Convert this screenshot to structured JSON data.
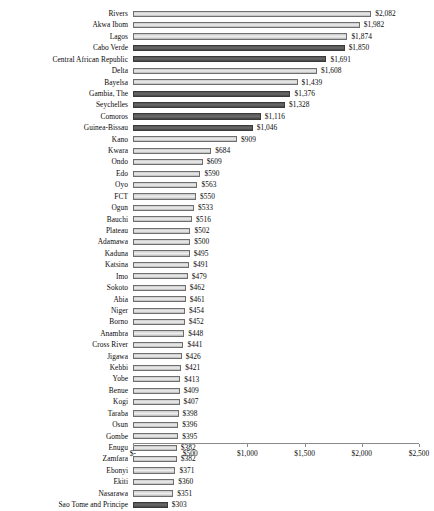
{
  "chart_data": {
    "type": "bar",
    "orientation": "horizontal",
    "title": "",
    "subtitle": "",
    "xlabel": "",
    "ylabel": "",
    "xlim": [
      0,
      2500
    ],
    "grid": false,
    "legend": null,
    "axis": {
      "tick_values": [
        0,
        500,
        1000,
        1500,
        2000,
        2500
      ],
      "tick_labels": [
        "$-",
        "$500",
        "$1,000",
        "$1,500",
        "$2,000",
        "$2,500"
      ]
    },
    "series_colors": {
      "light": "#d8d8d8",
      "dark": "#5b5b5b",
      "light_border": "#6e6e6e",
      "dark_border": "#3a3a3a"
    },
    "categories": [
      "Rivers",
      "Akwa Ibom",
      "Lagos",
      "Cabo Verde",
      "Central African Republic",
      "Delta",
      "Bayelsa",
      "Gambia, The",
      "Seychelles",
      "Comoros",
      "Guinea-Bissau",
      "Kano",
      "Kwara",
      "Ondo",
      "Edo",
      "Oyo",
      "FCT",
      "Ogun",
      "Bauchi",
      "Plateau",
      "Adamawa",
      "Kaduna",
      "Katsina",
      "Imo",
      "Sokoto",
      "Abia",
      "Niger",
      "Borno",
      "Anambra",
      "Cross River",
      "Jigawa",
      "Kebbi",
      "Yobe",
      "Benue",
      "Kogi",
      "Taraba",
      "Osun",
      "Gombe",
      "Enugu",
      "Zamfara",
      "Ebonyi",
      "Ekiti",
      "Nasarawa",
      "Sao Tome and Principe"
    ],
    "values": [
      2082,
      1982,
      1874,
      1850,
      1691,
      1608,
      1439,
      1376,
      1328,
      1116,
      1046,
      909,
      684,
      609,
      590,
      563,
      550,
      533,
      516,
      502,
      500,
      495,
      491,
      479,
      462,
      461,
      454,
      452,
      448,
      441,
      426,
      421,
      413,
      409,
      407,
      398,
      396,
      395,
      382,
      382,
      371,
      360,
      351,
      303
    ],
    "value_labels": [
      "$2,082",
      "$1,982",
      "$1,874",
      "$1,850",
      "$1,691",
      "$1,608",
      "$1,439",
      "$1,376",
      "$1,328",
      "$1,116",
      "$1,046",
      "$909",
      "$684",
      "$609",
      "$590",
      "$563",
      "$550",
      "$533",
      "$516",
      "$502",
      "$500",
      "$495",
      "$491",
      "$479",
      "$462",
      "$461",
      "$454",
      "$452",
      "$448",
      "$441",
      "$426",
      "$421",
      "$413",
      "$409",
      "$407",
      "$398",
      "$396",
      "$395",
      "$382",
      "$382",
      "$371",
      "$360",
      "$351",
      "$303"
    ],
    "bar_shades": [
      "light",
      "light",
      "light",
      "dark",
      "dark",
      "light",
      "light",
      "dark",
      "dark",
      "dark",
      "dark",
      "light",
      "light",
      "light",
      "light",
      "light",
      "light",
      "light",
      "light",
      "light",
      "light",
      "light",
      "light",
      "light",
      "light",
      "light",
      "light",
      "light",
      "light",
      "light",
      "light",
      "light",
      "light",
      "light",
      "light",
      "light",
      "light",
      "light",
      "light",
      "light",
      "light",
      "light",
      "light",
      "dark"
    ]
  }
}
